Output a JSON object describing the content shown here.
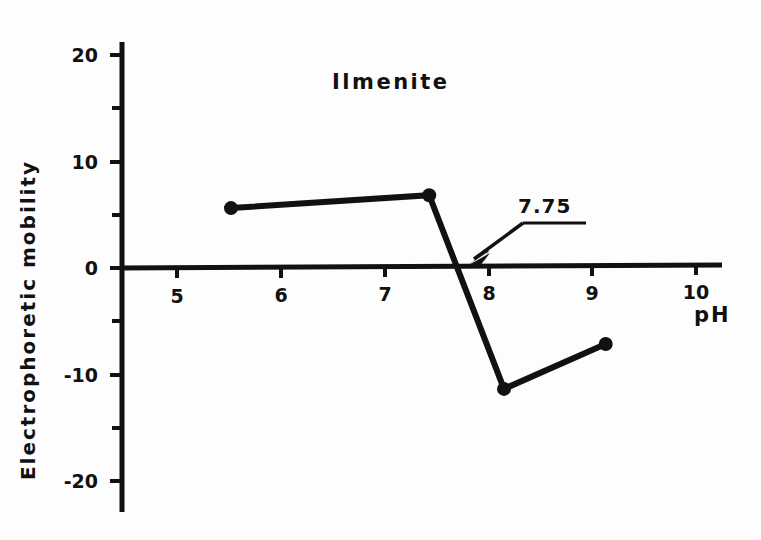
{
  "chart_data": {
    "type": "line",
    "title": "Ilmenite",
    "xlabel": "pH",
    "ylabel": "Electrophoretic  mobility",
    "xlim": [
      4.45,
      10.3
    ],
    "ylim": [
      -22.0,
      21.5
    ],
    "grid": false,
    "legend": null,
    "x_ticks": [
      5,
      6,
      7,
      8,
      9,
      10
    ],
    "x_tick_labels": [
      "5",
      "6",
      "7",
      "8",
      "9",
      "10"
    ],
    "y_ticks": [
      -20,
      -15,
      -10,
      -5,
      0,
      5,
      10,
      15,
      20
    ],
    "y_tick_labels": [
      "-20",
      "",
      "-10",
      "",
      "0",
      "",
      "10",
      "",
      "20"
    ],
    "y_major_labeled": [
      "20",
      "10",
      "0",
      "-10",
      "-20"
    ],
    "series": [
      {
        "name": "Ilmenite",
        "marker": "filled-circle",
        "color": "#111111",
        "x": [
          5.52,
          7.43,
          8.15,
          9.13
        ],
        "y": [
          5.6,
          6.8,
          -11.3,
          -7.1
        ]
      }
    ],
    "annotations": [
      {
        "text": "7.75",
        "type": "arrow-label",
        "target_x": 7.75,
        "target_y": 0.0,
        "label_x": 8.35,
        "label_y": 4.6
      }
    ],
    "iep_value": "7.75"
  },
  "axes": {
    "x_axis_name": "ph-axis",
    "y_axis_name": "mobility-axis"
  }
}
